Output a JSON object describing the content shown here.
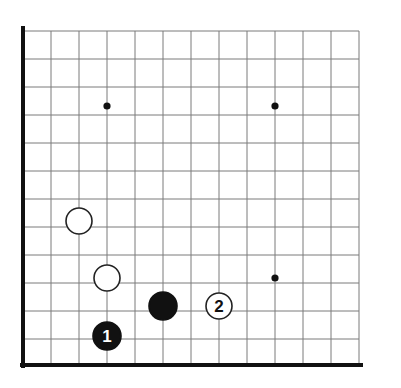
{
  "diagram": {
    "type": "go-board-diagram",
    "board": {
      "columns_shown": 13,
      "rows_shown": 13,
      "origin_corner": "bottom-left",
      "grid_color": "#7a7a7a",
      "edge_color": "#111111",
      "background_color": "#ffffff",
      "grid_spacing_px": 28,
      "left_edge_x": 23,
      "top_edge_y": 31,
      "bottom_edge_y": 365,
      "right_edge_x": 359,
      "edge_line_width": 4,
      "grid_line_width": 1
    },
    "star_points": [
      {
        "name": "star-point-upper-left",
        "col": 3,
        "row": 3,
        "cx": 107,
        "cy": 106,
        "r": 3.6
      },
      {
        "name": "star-point-upper-right",
        "col": 9,
        "row": 3,
        "cx": 275,
        "cy": 106,
        "r": 3.6
      },
      {
        "name": "star-point-lower-right",
        "col": 9,
        "row": 9,
        "cx": 275,
        "cy": 278,
        "r": 3.6
      }
    ],
    "stones": [
      {
        "id": "white-stone-upper",
        "color": "white",
        "label": "",
        "col": 3,
        "row": 7,
        "cx": 79,
        "cy": 221,
        "r": 13,
        "fill": "#ffffff",
        "stroke": "#222222"
      },
      {
        "id": "white-stone-middle",
        "color": "white",
        "label": "",
        "col": 4,
        "row": 9,
        "cx": 107,
        "cy": 278,
        "r": 13,
        "fill": "#ffffff",
        "stroke": "#222222"
      },
      {
        "id": "black-stone-plain",
        "color": "black",
        "label": "",
        "col": 6,
        "row": 10,
        "cx": 163,
        "cy": 306,
        "r": 14,
        "fill": "#111111",
        "stroke": "#111111"
      },
      {
        "id": "white-stone-move-2",
        "color": "white",
        "label": "2",
        "col": 8,
        "row": 10,
        "cx": 219,
        "cy": 306,
        "r": 13,
        "fill": "#ffffff",
        "stroke": "#222222"
      },
      {
        "id": "black-stone-move-1",
        "color": "black",
        "label": "1",
        "col": 4,
        "row": 11,
        "cx": 107,
        "cy": 336,
        "r": 14,
        "fill": "#111111",
        "stroke": "#111111"
      }
    ],
    "move_numbers": {
      "black_move_1": "1",
      "white_move_2": "2"
    }
  }
}
